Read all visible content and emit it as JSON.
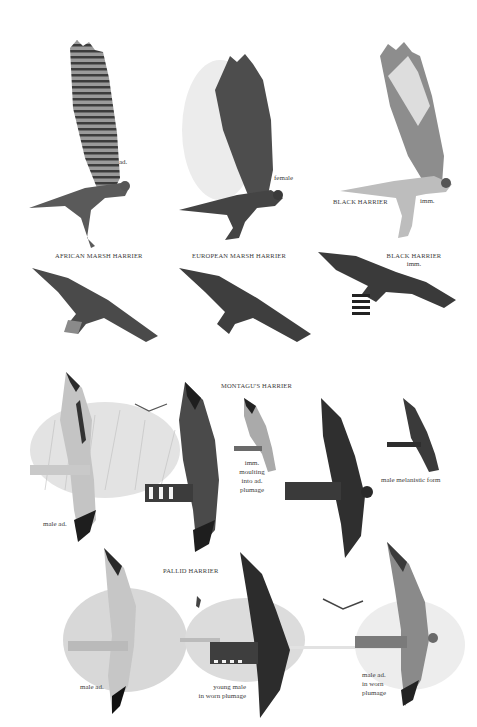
{
  "plate": {
    "top_section": {
      "perched_row": [
        {
          "species": "AFRICAN MARSH HARRIER",
          "note": "ad."
        },
        {
          "species": "EUROPEAN MARSH HARRIER",
          "note": "female"
        },
        {
          "species": "BLACK HARRIER",
          "note": "imm."
        }
      ],
      "flight_row": [
        {
          "species": "AFRICAN MARSH HARRIER"
        },
        {
          "species": "EUROPEAN MARSH HARRIER"
        },
        {
          "species": "BLACK HARRIER",
          "note": "imm."
        }
      ]
    },
    "montagu": {
      "title": "MONTAGU'S HARRIER",
      "labels": {
        "male_ad": "male ad.",
        "imm": "imm.\nmoulting\ninto ad.\nplumage",
        "melanistic": "male melanistic form"
      }
    },
    "pallid": {
      "title": "PALLID HARRIER",
      "labels": {
        "male_ad": "male ad.",
        "young_male": "young male\nin worn plumage",
        "male_worn": "male ad.\nin worn\nplumage"
      }
    },
    "colors": {
      "background": "#ffffff",
      "text": "#3b3b3b",
      "dark_plumage": "#2e2e2e",
      "mid_plumage": "#6a6a6a",
      "light_plumage": "#b9b9b9",
      "grass": "#c9c9c9"
    }
  }
}
